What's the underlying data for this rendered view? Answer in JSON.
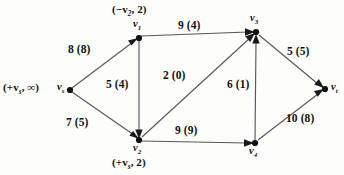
{
  "figure": {
    "type": "network-flow-graph",
    "caption": "",
    "colors": {
      "edge": "#58585a",
      "node": "#111111",
      "text": "#111111",
      "background": "#fdfdfc"
    }
  },
  "nodes": [
    {
      "id": "vs",
      "name": "v",
      "subscript": "s",
      "x": 70,
      "y": 90,
      "annotation_text": "(+v",
      "annotation_sub": "s",
      "annotation_tail": ", ∞)",
      "annotation_x": 3,
      "annotation_y": 82,
      "label_x": 57,
      "label_y": 82
    },
    {
      "id": "v1",
      "name": "v",
      "subscript": "1",
      "x": 139,
      "y": 38,
      "annotation_text": "(−v",
      "annotation_sub": "2",
      "annotation_tail": ", 2)",
      "annotation_x": 112,
      "annotation_y": 4,
      "label_x": 133,
      "label_y": 19
    },
    {
      "id": "v2",
      "name": "v",
      "subscript": "2",
      "x": 139,
      "y": 140,
      "annotation_text": "(+v",
      "annotation_sub": "s",
      "annotation_tail": ", 2)",
      "annotation_x": 112,
      "annotation_y": 157,
      "label_x": 133,
      "label_y": 143
    },
    {
      "id": "v3",
      "name": "v",
      "subscript": "3",
      "x": 256,
      "y": 32,
      "annotation_text": "",
      "annotation_sub": "",
      "annotation_tail": "",
      "annotation_x": 0,
      "annotation_y": 0,
      "label_x": 250,
      "label_y": 13
    },
    {
      "id": "v4",
      "name": "v",
      "subscript": "4",
      "x": 255,
      "y": 143,
      "annotation_text": "",
      "annotation_sub": "",
      "annotation_tail": "",
      "annotation_x": 0,
      "annotation_y": 0,
      "label_x": 249,
      "label_y": 146
    },
    {
      "id": "vt",
      "name": "v",
      "subscript": "t",
      "x": 325,
      "y": 89,
      "annotation_text": "",
      "annotation_sub": "",
      "annotation_tail": "",
      "annotation_x": 0,
      "annotation_y": 0,
      "label_x": 331,
      "label_y": 82
    }
  ],
  "edges": [
    {
      "id": "vs-v1",
      "from": "vs",
      "to": "v1",
      "capacity": 8,
      "flow": 8,
      "label": "8 (8)",
      "label_x": 68,
      "label_y": 44
    },
    {
      "id": "vs-v2",
      "from": "vs",
      "to": "v2",
      "capacity": 7,
      "flow": 5,
      "label": "7 (5)",
      "label_x": 66,
      "label_y": 117
    },
    {
      "id": "v1-v3",
      "from": "v1",
      "to": "v3",
      "capacity": 9,
      "flow": 4,
      "label": "9 (4)",
      "label_x": 178,
      "label_y": 20
    },
    {
      "id": "v1-v2",
      "from": "v1",
      "to": "v2",
      "capacity": 5,
      "flow": 4,
      "label": "5 (4)",
      "label_x": 106,
      "label_y": 79
    },
    {
      "id": "v2-v3",
      "from": "v2",
      "to": "v3",
      "capacity": 2,
      "flow": 0,
      "label": "2 (0)",
      "label_x": 163,
      "label_y": 70
    },
    {
      "id": "v2-v4",
      "from": "v2",
      "to": "v4",
      "capacity": 9,
      "flow": 9,
      "label": "9 (9)",
      "label_x": 175,
      "label_y": 125
    },
    {
      "id": "v4-v3",
      "from": "v4",
      "to": "v3",
      "capacity": 6,
      "flow": 1,
      "label": "6 (1)",
      "label_x": 227,
      "label_y": 79
    },
    {
      "id": "v3-vt",
      "from": "v3",
      "to": "vt",
      "capacity": 5,
      "flow": 5,
      "label": "5 (5)",
      "label_x": 287,
      "label_y": 46
    },
    {
      "id": "v4-vt",
      "from": "v4",
      "to": "vt",
      "capacity": 10,
      "flow": 8,
      "label": "10 (8)",
      "label_x": 286,
      "label_y": 113
    }
  ]
}
